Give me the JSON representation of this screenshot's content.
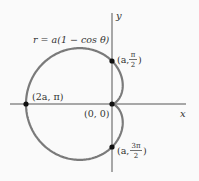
{
  "figure": {
    "equation": "r = a(1 − cos θ)",
    "axis_x_label": "x",
    "axis_y_label": "y",
    "points": [
      {
        "label_pre": "(a, ",
        "num": "π",
        "den": "2",
        "label_post": ")"
      },
      {
        "label": "(2a, π)"
      },
      {
        "label": "(0, 0)"
      },
      {
        "label_pre": "(a, ",
        "num": "3π",
        "den": "2",
        "label_post": ")"
      }
    ],
    "colors": {
      "curve": "#7a7a7a",
      "axis": "#555555",
      "point": "#111111"
    }
  }
}
